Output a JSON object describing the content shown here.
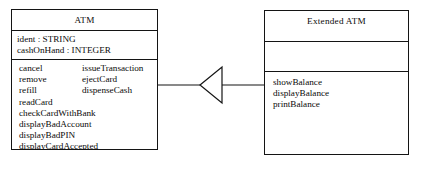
{
  "diagram": {
    "type": "uml-class-diagram",
    "notation": "UML",
    "background_color": "#ffffff",
    "line_color": "#141414"
  },
  "classes": [
    {
      "id": "atm",
      "name": "ATM",
      "role": "superclass",
      "attributes": [
        "ident : STRING",
        "cashOnHand : INTEGER"
      ],
      "operations_column_left": [
        "cancel",
        "remove",
        "refill",
        "readCard",
        "checkCardWithBank",
        "displayBadAccount",
        "displayBadPIN",
        "displayCardAccepted",
        "displayTransactionFailed"
      ],
      "operations_column_right": [
        "issueTransaction",
        "ejectCard",
        "dispenseCash"
      ]
    },
    {
      "id": "extended-atm",
      "name": "Extended ATM",
      "role": "subclass",
      "attributes": [],
      "operations": [
        "showBalance",
        "displayBalance",
        "printBalance"
      ]
    }
  ],
  "relationships": [
    {
      "id": "generalization-1",
      "kind": "generalization",
      "from": "Extended ATM",
      "to": "ATM",
      "arrow": "hollow-triangle",
      "arrow_direction": "left"
    }
  ]
}
